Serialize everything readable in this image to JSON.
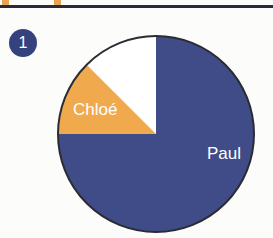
{
  "page": {
    "background_color": "#fcfcfa"
  },
  "divider": {
    "name": "top-rule",
    "color": "#2b2b33",
    "tick_color": "#e8a451",
    "tick_count": 2
  },
  "badge": {
    "label": "1",
    "background_color": "#34437e",
    "text_color": "#ffffff"
  },
  "chart_data": {
    "type": "pie",
    "title": "",
    "subtitle": "",
    "xlabel": "",
    "ylabel": "",
    "legend": "none",
    "grid": false,
    "outline_color": "#2b2b33",
    "start_angle_deg": 90,
    "direction": "clockwise",
    "categories": [
      "Paul",
      "unlabelled",
      "Chloé"
    ],
    "values": [
      75,
      12.5,
      12.5
    ],
    "labels_shown": [
      "Paul",
      "Chloé"
    ],
    "colors": [
      "#3f4c88",
      "#ffffff",
      "#f0a94c"
    ],
    "slices": [
      {
        "name": "Paul",
        "value": 75,
        "percent": "75%",
        "color": "#3f4c88",
        "label": "Paul",
        "label_color": "#ffffff",
        "label_x": 168,
        "label_y": 125
      },
      {
        "name": "unlabelled",
        "value": 12.5,
        "percent": "12.5%",
        "color": "#ffffff",
        "label": "",
        "label_color": "",
        "label_x": 0,
        "label_y": 0
      },
      {
        "name": "Chloé",
        "value": 12.5,
        "percent": "12.5%",
        "color": "#f0a94c",
        "label": "Chloé",
        "label_color": "#ffffff",
        "label_x": 17,
        "label_y": 81
      }
    ]
  }
}
